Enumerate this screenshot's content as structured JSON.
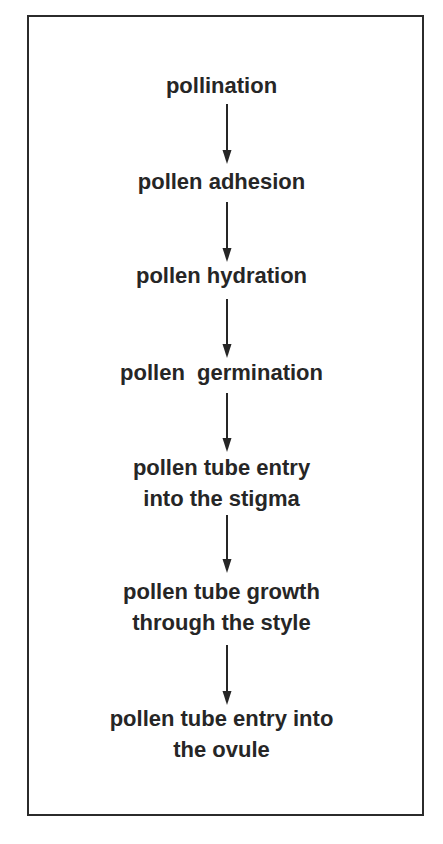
{
  "diagram": {
    "steps": [
      {
        "id": "pollination",
        "text": "pollination"
      },
      {
        "id": "pollen-adhesion",
        "text": "pollen adhesion"
      },
      {
        "id": "pollen-hydration",
        "text": "pollen hydration"
      },
      {
        "id": "pollen-germination",
        "text": "pollen  germination"
      },
      {
        "id": "pollen-tube-entry-stigma",
        "text": "pollen tube entry\ninto the stigma"
      },
      {
        "id": "pollen-tube-growth-style",
        "text": "pollen tube growth\nthrough the style"
      },
      {
        "id": "pollen-tube-entry-ovule",
        "text": "pollen tube entry into\nthe ovule"
      }
    ],
    "edges": [
      {
        "from": "pollination",
        "to": "pollen-adhesion"
      },
      {
        "from": "pollen-adhesion",
        "to": "pollen-hydration"
      },
      {
        "from": "pollen-hydration",
        "to": "pollen-germination"
      },
      {
        "from": "pollen-germination",
        "to": "pollen-tube-entry-stigma"
      },
      {
        "from": "pollen-tube-entry-stigma",
        "to": "pollen-tube-growth-style"
      },
      {
        "from": "pollen-tube-growth-style",
        "to": "pollen-tube-entry-ovule"
      }
    ],
    "colors": {
      "ink": "#262626",
      "background": "#ffffff"
    }
  }
}
